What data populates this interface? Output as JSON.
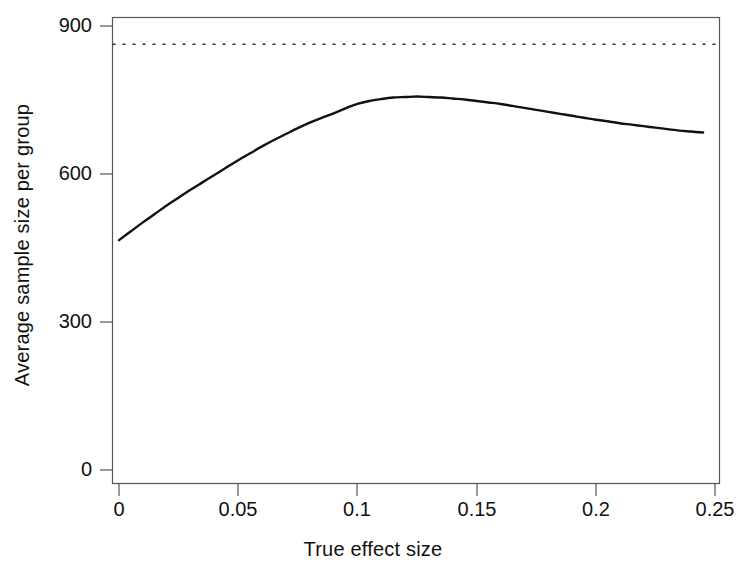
{
  "chart_data": {
    "type": "line",
    "title": "",
    "xlabel": "True effect size",
    "ylabel": "Average sample size per group",
    "xlim": [
      -0.0042,
      0.2542
    ],
    "ylim": [
      0,
      940
    ],
    "grid": false,
    "legend": "none",
    "frame": "box",
    "xticks": [
      0,
      0.05,
      0.1,
      0.15,
      0.2,
      0.25
    ],
    "xtick_labels": [
      "0",
      "0.05",
      "0.1",
      "0.15",
      "0.2",
      "0.25"
    ],
    "yticks": [
      0,
      300,
      600,
      900
    ],
    "ytick_labels": [
      "0",
      "300",
      "600",
      "900"
    ],
    "series": [
      {
        "name": "Average sample size per group",
        "style": "solid",
        "color": "#111111",
        "width": 2.4,
        "x": [
          0.0,
          0.005,
          0.01,
          0.015,
          0.02,
          0.025,
          0.03,
          0.035,
          0.04,
          0.045,
          0.05,
          0.055,
          0.06,
          0.065,
          0.07,
          0.075,
          0.08,
          0.085,
          0.09,
          0.095,
          0.1,
          0.105,
          0.11,
          0.115,
          0.12,
          0.125,
          0.13,
          0.135,
          0.14,
          0.145,
          0.15,
          0.155,
          0.16,
          0.165,
          0.17,
          0.175,
          0.18,
          0.185,
          0.19,
          0.195,
          0.2,
          0.205,
          0.21,
          0.215,
          0.22,
          0.225,
          0.23,
          0.235,
          0.24,
          0.245
        ],
        "y": [
          466,
          484,
          502,
          519,
          536,
          552,
          568,
          583,
          598,
          613,
          628,
          642,
          656,
          669,
          681,
          693,
          704,
          714,
          723,
          733,
          742,
          748,
          752,
          755,
          756,
          757,
          756,
          755,
          753,
          751,
          748,
          745,
          742,
          738,
          734,
          730,
          726,
          722,
          718,
          714,
          710,
          707,
          703,
          700,
          697,
          694,
          691,
          688,
          686,
          684
        ]
      },
      {
        "name": "reference",
        "style": "dotted",
        "color": "#333333",
        "width": 1.6,
        "constant_y": 863,
        "x": [
          0.0,
          0.2542
        ],
        "y": [
          863,
          863
        ]
      }
    ]
  },
  "axes": {
    "x_title": "True effect size",
    "y_title": "Average sample size per group",
    "x_tick_labels": [
      "0",
      "0.05",
      "0.1",
      "0.15",
      "0.2",
      "0.25"
    ],
    "y_tick_labels": [
      "900",
      "600",
      "300",
      "0"
    ]
  },
  "colors": {
    "background": "#ffffff",
    "frame": "#555555",
    "curve": "#111111",
    "reference_line": "#333333",
    "text": "#111111"
  }
}
